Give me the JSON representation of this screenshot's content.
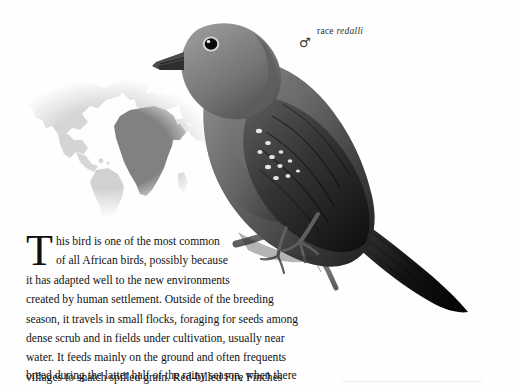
{
  "page": {
    "kind": "field-guide-plate",
    "background_color": "#fefefe"
  },
  "caption": {
    "prefix": "race ",
    "species_race": "redalli",
    "sex_symbol": "♂",
    "sex_name": "male"
  },
  "map": {
    "highlight_region": "Africa",
    "highlight_color": "#7b7b7b",
    "landmass_color": "#d4d4d4",
    "ocean_color": "#ffffff"
  },
  "illustration": {
    "subject": "Red-billed Fire Finch",
    "style": "grayscale engraving",
    "perch": "branch"
  },
  "body": {
    "dropcap": "T",
    "lines": [
      "his bird is one of the most common",
      "of all African birds, possibly because",
      "it has adapted well to the new environments",
      "created by human settlement. Outside of the breeding",
      "season, it travels in small flocks, foraging for seeds among",
      "dense scrub and in fields under cultivation, usually near",
      "water. It feeds mainly on the ground and often frequents",
      "villages to snatch spilled grain. Red-billed Fire Finches"
    ],
    "last_line": "breed during the latter half of the rainy season, when there",
    "full_text": "This bird is one of the most common of all African birds, possibly because it has adapted well to the new environments created by human settlement. Outside of the breeding season, it travels in small flocks, foraging for seeds among dense scrub and in fields under cultivation, usually near water. It feeds mainly on the ground and often frequents villages to snatch spilled grain. Red-billed Fire Finches breed during the latter half of the rainy season, when there"
  }
}
